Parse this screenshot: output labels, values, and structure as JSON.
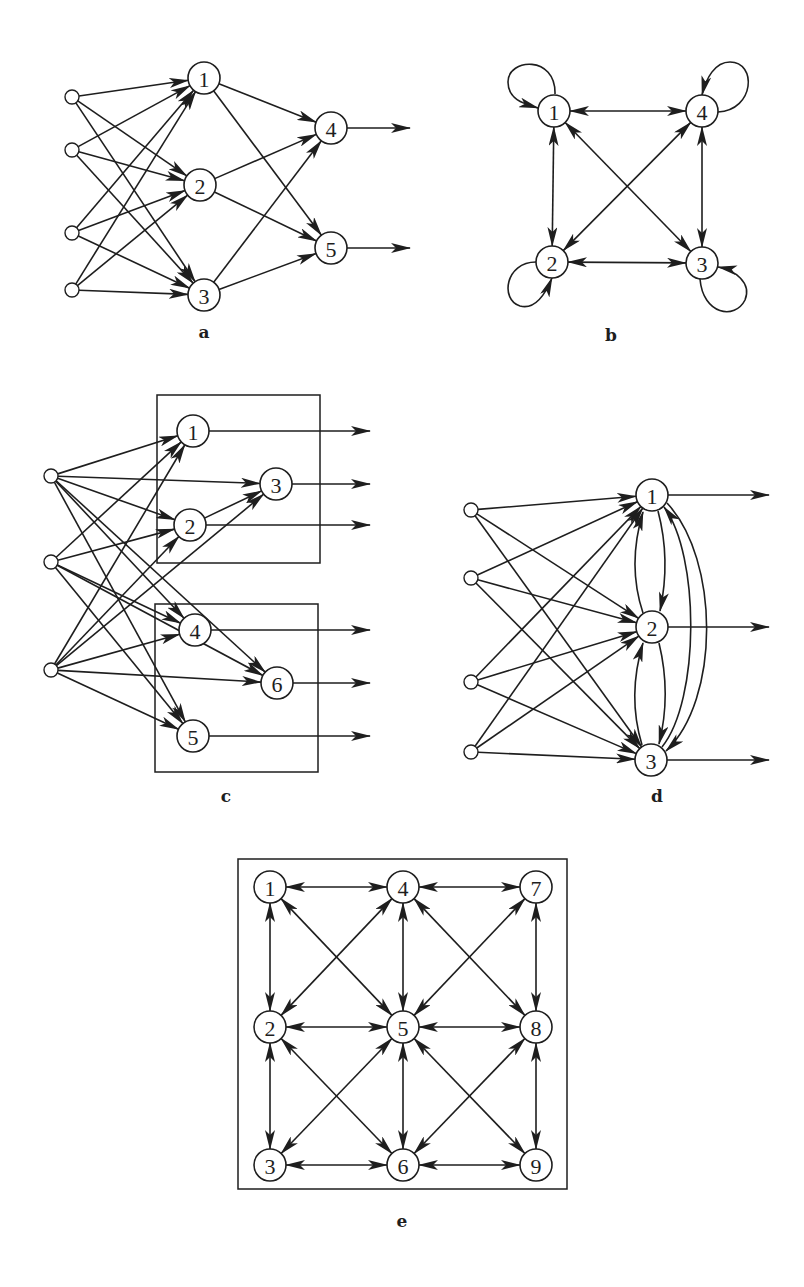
{
  "colors": {
    "ink": "#1e1e1e",
    "background": "#ffffff"
  },
  "panels": [
    {
      "id": "a",
      "label": "a",
      "description": "feed-forward network: 4 inputs, hidden layer 1-3, output layer 4-5",
      "inputs": 4,
      "nodes": [
        "1",
        "2",
        "3",
        "4",
        "5"
      ],
      "edges_from_inputs": {
        "0": [
          "1",
          "2",
          "3"
        ],
        "1": [
          "1",
          "2",
          "3"
        ],
        "2": [
          "1",
          "2",
          "3"
        ],
        "3": [
          "1",
          "2",
          "3"
        ]
      },
      "edges": [
        [
          "1",
          "4"
        ],
        [
          "1",
          "5"
        ],
        [
          "2",
          "4"
        ],
        [
          "2",
          "5"
        ],
        [
          "3",
          "4"
        ],
        [
          "3",
          "5"
        ]
      ],
      "outputs": [
        "4",
        "5"
      ]
    },
    {
      "id": "b",
      "label": "b",
      "description": "fully connected recurrent network with self-loops",
      "nodes": [
        "1",
        "2",
        "3",
        "4"
      ],
      "bidirectional_edges": [
        [
          "1",
          "4"
        ],
        [
          "1",
          "2"
        ],
        [
          "1",
          "3"
        ],
        [
          "4",
          "2"
        ],
        [
          "4",
          "3"
        ],
        [
          "2",
          "3"
        ]
      ],
      "self_loops": [
        "1",
        "2",
        "3",
        "4"
      ]
    },
    {
      "id": "c",
      "label": "c",
      "description": "two-module network with 3 inputs; modules {1,2,3} and {4,5,6}",
      "inputs": 3,
      "nodes": [
        "1",
        "2",
        "3",
        "4",
        "5",
        "6"
      ],
      "modules": [
        [
          "1",
          "2",
          "3"
        ],
        [
          "4",
          "5",
          "6"
        ]
      ],
      "edges_from_inputs": {
        "0": [
          "1",
          "3",
          "2",
          "4",
          "6",
          "5"
        ],
        "1": [
          "1",
          "2",
          "4",
          "6",
          "5"
        ],
        "2": [
          "1",
          "2",
          "3",
          "4",
          "6",
          "5"
        ]
      },
      "edges": [
        [
          "2",
          "3"
        ]
      ],
      "outputs": [
        "1",
        "3",
        "2",
        "4",
        "6",
        "5"
      ]
    },
    {
      "id": "d",
      "label": "d",
      "description": "4 inputs fully connected to mutually recurrent layer 1-3",
      "inputs": 4,
      "nodes": [
        "1",
        "2",
        "3"
      ],
      "edges_from_inputs": {
        "0": [
          "1",
          "2",
          "3"
        ],
        "1": [
          "1",
          "2",
          "3"
        ],
        "2": [
          "1",
          "2",
          "3"
        ],
        "3": [
          "1",
          "2",
          "3"
        ]
      },
      "curved_edges": [
        [
          "2",
          "1"
        ],
        [
          "1",
          "2"
        ],
        [
          "3",
          "2"
        ],
        [
          "2",
          "3"
        ],
        [
          "3",
          "1"
        ],
        [
          "1",
          "3"
        ]
      ],
      "outputs": [
        "1",
        "2",
        "3"
      ]
    },
    {
      "id": "e",
      "label": "e",
      "description": "3x3 lattice with bidirectional nearest-neighbour and diagonal connections",
      "nodes": [
        "1",
        "2",
        "3",
        "4",
        "5",
        "6",
        "7",
        "8",
        "9"
      ],
      "bidirectional_edges": [
        [
          "1",
          "4"
        ],
        [
          "4",
          "7"
        ],
        [
          "2",
          "5"
        ],
        [
          "5",
          "8"
        ],
        [
          "3",
          "6"
        ],
        [
          "6",
          "9"
        ],
        [
          "1",
          "2"
        ],
        [
          "2",
          "3"
        ],
        [
          "4",
          "5"
        ],
        [
          "5",
          "6"
        ],
        [
          "7",
          "8"
        ],
        [
          "8",
          "9"
        ],
        [
          "1",
          "5"
        ],
        [
          "4",
          "2"
        ],
        [
          "4",
          "8"
        ],
        [
          "7",
          "5"
        ],
        [
          "2",
          "6"
        ],
        [
          "5",
          "3"
        ],
        [
          "5",
          "9"
        ],
        [
          "8",
          "6"
        ]
      ]
    }
  ]
}
